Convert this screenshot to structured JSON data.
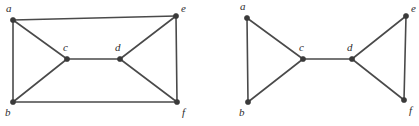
{
  "figure": {
    "background_color": "#ffffff",
    "edge_color": "#4a4a4a",
    "vertex_color": "#3a3a3a",
    "label_color": "#2e2e2e",
    "graphs": [
      {
        "id": "left-graph",
        "name": "left-graph",
        "vertices": [
          {
            "id": "a",
            "label": "a",
            "x": 13,
            "y": 20,
            "label_x": 6,
            "label_y": 12
          },
          {
            "id": "b",
            "label": "b",
            "x": 13,
            "y": 102,
            "label_x": 5,
            "label_y": 116
          },
          {
            "id": "c",
            "label": "c",
            "x": 67,
            "y": 59,
            "label_x": 63,
            "label_y": 51
          },
          {
            "id": "d",
            "label": "d",
            "x": 120,
            "y": 59,
            "label_x": 115,
            "label_y": 51
          },
          {
            "id": "e",
            "label": "e",
            "x": 176,
            "y": 16,
            "label_x": 181,
            "label_y": 12
          },
          {
            "id": "f",
            "label": "f",
            "x": 177,
            "y": 102,
            "label_x": 182,
            "label_y": 116
          }
        ],
        "edges": [
          {
            "from": "a",
            "to": "e",
            "name": "edge-a-e"
          },
          {
            "from": "a",
            "to": "b",
            "name": "edge-a-b"
          },
          {
            "from": "a",
            "to": "c",
            "name": "edge-a-c"
          },
          {
            "from": "b",
            "to": "c",
            "name": "edge-b-c"
          },
          {
            "from": "b",
            "to": "f",
            "name": "edge-b-f"
          },
          {
            "from": "c",
            "to": "d",
            "name": "edge-c-d"
          },
          {
            "from": "d",
            "to": "e",
            "name": "edge-d-e"
          },
          {
            "from": "d",
            "to": "f",
            "name": "edge-d-f"
          },
          {
            "from": "e",
            "to": "f",
            "name": "edge-e-f"
          }
        ]
      },
      {
        "id": "right-graph",
        "name": "right-graph",
        "vertices": [
          {
            "id": "a",
            "label": "a",
            "x": 247,
            "y": 18,
            "label_x": 240,
            "label_y": 10
          },
          {
            "id": "b",
            "label": "b",
            "x": 248,
            "y": 102,
            "label_x": 239,
            "label_y": 116
          },
          {
            "id": "c",
            "label": "c",
            "x": 303,
            "y": 59,
            "label_x": 299,
            "label_y": 51
          },
          {
            "id": "d",
            "label": "d",
            "x": 352,
            "y": 59,
            "label_x": 347,
            "label_y": 51
          },
          {
            "id": "e",
            "label": "e",
            "x": 406,
            "y": 16,
            "label_x": 411,
            "label_y": 12
          },
          {
            "id": "f",
            "label": "f",
            "x": 404,
            "y": 100,
            "label_x": 409,
            "label_y": 114
          }
        ],
        "edges": [
          {
            "from": "a",
            "to": "b",
            "name": "edge-a-b"
          },
          {
            "from": "a",
            "to": "c",
            "name": "edge-a-c"
          },
          {
            "from": "b",
            "to": "c",
            "name": "edge-b-c"
          },
          {
            "from": "c",
            "to": "d",
            "name": "edge-c-d"
          },
          {
            "from": "d",
            "to": "e",
            "name": "edge-d-e"
          },
          {
            "from": "d",
            "to": "f",
            "name": "edge-d-f"
          },
          {
            "from": "e",
            "to": "f",
            "name": "edge-e-f"
          }
        ]
      }
    ]
  }
}
